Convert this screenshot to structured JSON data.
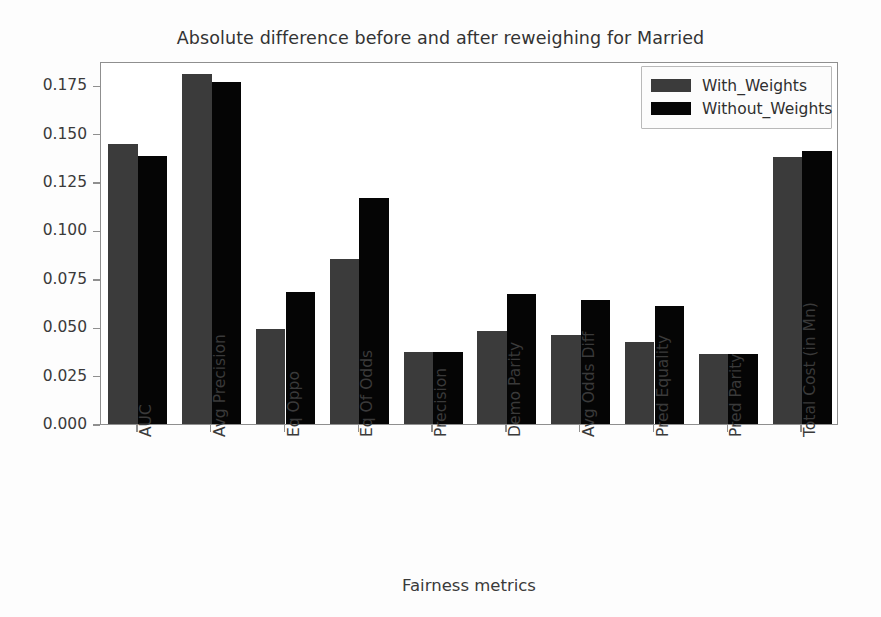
{
  "chart_data": {
    "type": "bar",
    "title": "Absolute difference before and after reweighing for Married",
    "xlabel": "Fairness metrics",
    "ylabel": "",
    "grid": false,
    "legend_position": "upper right",
    "ylim": [
      0.0,
      0.1875
    ],
    "yticks": [
      0.0,
      0.025,
      0.05,
      0.075,
      0.1,
      0.125,
      0.15,
      0.175
    ],
    "ytick_labels": [
      "0.000",
      "0.025",
      "0.050",
      "0.075",
      "0.100",
      "0.125",
      "0.150",
      "0.175"
    ],
    "categories": [
      "AUC",
      "Avg Precision",
      "Eq Oppo",
      "Eq Of Odds",
      "Precision",
      "Demo Parity",
      "Avg Odds Diff",
      "Pred Equality",
      "Pred Parity",
      "Total Cost (in Mn)"
    ],
    "series": [
      {
        "name": "With_Weights",
        "color": "#3b3b3b",
        "values": [
          0.1445,
          0.181,
          0.049,
          0.085,
          0.037,
          0.048,
          0.0458,
          0.0422,
          0.036,
          0.138
        ]
      },
      {
        "name": "Without_Weights",
        "color": "#050505",
        "values": [
          0.1385,
          0.1768,
          0.0682,
          0.1165,
          0.037,
          0.0672,
          0.064,
          0.0612,
          0.036,
          0.1408
        ]
      }
    ]
  },
  "legend": {
    "entries": [
      {
        "label": "With_Weights"
      },
      {
        "label": "Without_Weights"
      }
    ]
  }
}
